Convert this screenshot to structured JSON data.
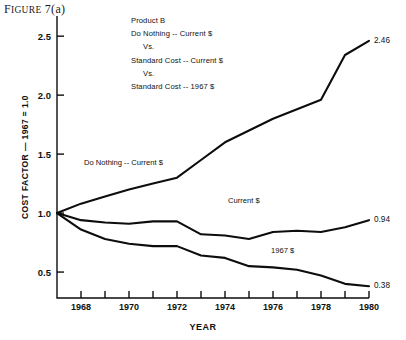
{
  "figure": {
    "title_prefix": "F",
    "title_small": "IGURE",
    "title_rest": " 7(a)"
  },
  "annotation": {
    "lines": [
      "Product B",
      "Do Nothing -- Current $",
      "Vs.",
      "Standard Cost -- Current $",
      "Vs.",
      "Standard Cost -- 1967 $"
    ]
  },
  "chart_data": {
    "type": "line",
    "title": "Figure 7(a)",
    "xlabel": "YEAR",
    "ylabel": "COST FACTOR — 1967 = 1.0",
    "xlim": [
      1967,
      1980
    ],
    "ylim": [
      0.28,
      2.62
    ],
    "yticks": [
      0.5,
      1.0,
      1.5,
      2.0,
      2.5
    ],
    "ytick_labels": [
      "0.5",
      "1.0",
      "1.5",
      "2.0",
      "2.5"
    ],
    "xticks": [
      1967,
      1968,
      1969,
      1970,
      1971,
      1972,
      1973,
      1974,
      1975,
      1976,
      1977,
      1978,
      1979,
      1980
    ],
    "xtick_labels_shown": [
      "1968",
      "1970",
      "1972",
      "1974",
      "1976",
      "1978",
      "1980"
    ],
    "grid": false,
    "legend_position": "inline-labels",
    "x": [
      1967,
      1968,
      1969,
      1970,
      1971,
      1972,
      1973,
      1974,
      1975,
      1976,
      1977,
      1978,
      1979,
      1980
    ],
    "series": [
      {
        "name": "Do Nothing -- Current $",
        "label_text": "Do Nothing -- Current $",
        "end_label": "2.46",
        "values": [
          1.0,
          1.08,
          1.14,
          1.2,
          1.25,
          1.3,
          1.45,
          1.6,
          1.7,
          1.8,
          1.88,
          1.96,
          2.34,
          2.46
        ]
      },
      {
        "name": "Current $",
        "label_text": "Current $",
        "end_label": "0.94",
        "values": [
          1.0,
          0.94,
          0.92,
          0.91,
          0.93,
          0.93,
          0.82,
          0.81,
          0.78,
          0.84,
          0.85,
          0.84,
          0.88,
          0.94
        ]
      },
      {
        "name": "1967 $",
        "label_text": "1967 $",
        "end_label": "0.38",
        "values": [
          1.0,
          0.86,
          0.78,
          0.74,
          0.72,
          0.72,
          0.64,
          0.62,
          0.55,
          0.54,
          0.52,
          0.47,
          0.4,
          0.38
        ]
      }
    ]
  },
  "colors": {
    "line": "#0d0d0d",
    "axis": "#0d0d0d",
    "background": "#ffffff"
  }
}
